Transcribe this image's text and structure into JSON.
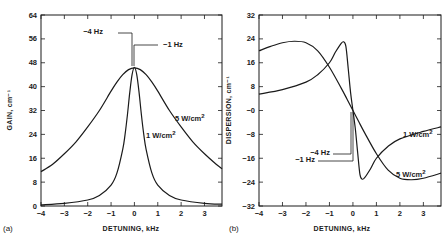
{
  "figure": {
    "background": "#ffffff",
    "ink_color": "#1a1a1a"
  },
  "chart_data": [
    {
      "type": "line",
      "panel_label": "(a)",
      "title": "",
      "xlabel": "DETUNING, kHz",
      "ylabel": "GAIN, cm⁻¹",
      "xlim": [
        -4,
        3.75
      ],
      "ylim": [
        0,
        64
      ],
      "xticks": [
        -4,
        -3,
        -2,
        -1,
        0,
        1,
        2,
        3
      ],
      "xtick_labels": [
        "−4",
        "−3",
        "−2",
        "−1",
        "0",
        "1",
        "2",
        "3"
      ],
      "yticks": [
        0,
        8,
        16,
        24,
        32,
        40,
        48,
        56,
        64
      ],
      "ytick_labels": [
        "0",
        "8",
        "16",
        "24",
        "32",
        "40",
        "48",
        "56",
        "64"
      ],
      "grid": false,
      "frame_px": {
        "x0": 41,
        "x1": 222,
        "y0": 15,
        "y1": 206
      },
      "series": [
        {
          "name": "5 W/cm²",
          "x": [
            -4,
            -3.5,
            -3,
            -2.5,
            -2,
            -1.5,
            -1,
            -0.75,
            -0.5,
            -0.25,
            0,
            0.25,
            0.5,
            0.75,
            1,
            1.5,
            2,
            2.5,
            3,
            3.5,
            3.75
          ],
          "y": [
            11.5,
            14,
            17.5,
            21.5,
            26.5,
            32,
            38.5,
            41.5,
            44,
            45.7,
            46.3,
            45.7,
            44,
            41.5,
            38.5,
            32,
            26.5,
            21.5,
            17.5,
            14,
            12.5
          ]
        },
        {
          "name": "1 W/cm²",
          "x": [
            -4,
            -3,
            -2,
            -1.5,
            -1,
            -0.75,
            -0.5,
            -0.4,
            -0.3,
            -0.2,
            -0.1,
            0,
            0.1,
            0.2,
            0.3,
            0.4,
            0.5,
            0.75,
            1,
            1.5,
            2,
            3,
            3.75
          ],
          "y": [
            0.4,
            0.9,
            2,
            3.5,
            7,
            11,
            19,
            24,
            30.5,
            38,
            44,
            46.5,
            44,
            38,
            30.5,
            24,
            19,
            11,
            7,
            3.5,
            2,
            0.9,
            0.6
          ]
        }
      ],
      "annotations": [
        {
          "text": "−4 Hz",
          "x": 103,
          "y": 34,
          "anchor": "end"
        },
        {
          "text": "−1 Hz",
          "x": 163,
          "y": 47,
          "anchor": "start"
        },
        {
          "text": "5 W/cm",
          "sup": "2",
          "x": 175,
          "y": 121,
          "anchor": "start"
        },
        {
          "text": "1 W/cm",
          "sup": "2",
          "x": 146,
          "y": 138,
          "anchor": "start"
        }
      ],
      "leaders": [
        {
          "points": [
            [
              118,
              33
            ],
            [
              132,
              33
            ],
            [
              132,
              66
            ]
          ]
        },
        {
          "points": [
            [
              158,
              45
            ],
            [
              134,
              45
            ],
            [
              134,
              66
            ]
          ]
        }
      ]
    },
    {
      "type": "line",
      "panel_label": "(b)",
      "title": "",
      "xlabel": "DETUNING, kHz",
      "ylabel": "DISPERSION, cm⁻¹",
      "xlim": [
        -4,
        3.75
      ],
      "ylim": [
        -32,
        32
      ],
      "xticks": [
        -4,
        -3,
        -2,
        -1,
        0,
        1,
        2,
        3
      ],
      "xtick_labels": [
        "−4",
        "−3",
        "−2",
        "−1",
        "0",
        "1",
        "2",
        "3"
      ],
      "yticks": [
        -32,
        -24,
        -16,
        -8,
        0,
        8,
        16,
        24,
        32
      ],
      "ytick_labels": [
        "−32",
        "−24",
        "−16",
        "−8",
        "−0",
        "8",
        "16",
        "24",
        "32"
      ],
      "grid": false,
      "frame_px": {
        "x0": 259,
        "x1": 441,
        "y0": 15,
        "y1": 206
      },
      "series": [
        {
          "name": "5 W/cm²",
          "x": [
            -4,
            -3.5,
            -3,
            -2.5,
            -2,
            -1.5,
            -1,
            -0.5,
            -0.25,
            0,
            0.25,
            0.5,
            1,
            1.5,
            2,
            2.5,
            3,
            3.75
          ],
          "y": [
            20,
            21.5,
            22.7,
            23.2,
            22.7,
            20,
            14.5,
            7.5,
            3.8,
            0,
            -3.8,
            -7.5,
            -14.5,
            -20,
            -22.7,
            -23.2,
            -22.7,
            -21
          ]
        },
        {
          "name": "1 W/cm²",
          "x": [
            -4,
            -3,
            -2,
            -1.5,
            -1,
            -0.75,
            -0.5,
            -0.4,
            -0.3,
            -0.2,
            -0.1,
            0,
            0.1,
            0.2,
            0.3,
            0.4,
            0.5,
            0.75,
            1,
            1.5,
            2,
            3,
            3.75
          ],
          "y": [
            5.5,
            7,
            9.5,
            12,
            16,
            19.5,
            22.5,
            23,
            21.5,
            14,
            6,
            0,
            -6,
            -14,
            -21.5,
            -23,
            -22.5,
            -19.5,
            -16,
            -12,
            -9.5,
            -7,
            -5.5
          ]
        }
      ],
      "annotations": [
        {
          "text": "−4 Hz",
          "x": 330,
          "y": 155,
          "anchor": "end"
        },
        {
          "text": "−1 Hz",
          "x": 315,
          "y": 162,
          "anchor": "end"
        },
        {
          "text": "1 W/cm",
          "sup": "2",
          "x": 403,
          "y": 137,
          "anchor": "start"
        },
        {
          "text": "5 W/cm",
          "sup": "2",
          "x": 396,
          "y": 177,
          "anchor": "start"
        }
      ],
      "leaders": [
        {
          "points": [
            [
              333,
              154
            ],
            [
              351,
              154
            ],
            [
              351,
              112
            ]
          ]
        },
        {
          "points": [
            [
              318,
              161
            ],
            [
              353,
              161
            ],
            [
              353,
              112
            ]
          ]
        }
      ]
    }
  ]
}
